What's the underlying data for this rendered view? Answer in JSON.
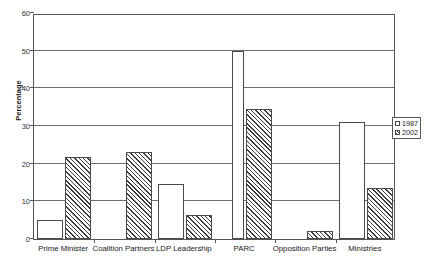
{
  "chart_data": {
    "type": "bar",
    "title": "",
    "xlabel": "",
    "ylabel": "Percentage",
    "ylim": [
      0,
      60
    ],
    "yticks": [
      0,
      10,
      20,
      30,
      40,
      50,
      60
    ],
    "grid": true,
    "legend_position": "right",
    "categories": [
      "Prime Minister",
      "Coalition Partners",
      "LDP Leadership",
      "PARC",
      "Opposition Parties",
      "Ministries"
    ],
    "series": [
      {
        "name": "1987",
        "values": [
          5.1,
          0,
          14.5,
          50,
          0,
          31
        ]
      },
      {
        "name": "2002",
        "values": [
          21.8,
          23,
          6.3,
          34.5,
          2,
          13.5
        ]
      }
    ]
  },
  "axis": {
    "y_title": "Percentage",
    "y_tick_labels": [
      "60",
      "50",
      "40",
      "30",
      "20",
      "10",
      "0"
    ]
  },
  "legend": {
    "items": [
      {
        "label": "1987"
      },
      {
        "label": "2002"
      }
    ]
  }
}
